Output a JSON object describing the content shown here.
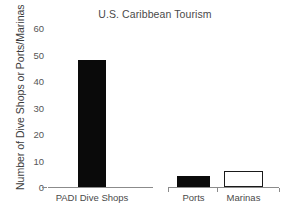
{
  "chart_data": {
    "type": "bar",
    "title": "U.S. Caribbean Tourism",
    "xlabel": "",
    "ylabel": "Number of Dive Shops or Ports/Marinas",
    "categories": [
      "PADI Dive Shops",
      "Ports",
      "Marinas"
    ],
    "values": [
      48,
      4,
      6
    ],
    "series": [
      {
        "name": "U.S. Caribbean Tourism",
        "values": [
          48,
          4,
          6
        ]
      }
    ],
    "bar_styles": [
      "filled",
      "filled",
      "open"
    ],
    "ylim": [
      0,
      62
    ],
    "yticks": [
      0,
      10,
      20,
      30,
      40,
      50,
      60
    ],
    "ytick_labels": [
      "0",
      "10",
      "20",
      "30",
      "40",
      "50",
      "60"
    ],
    "grid": false,
    "legend": null,
    "legend_position": "none",
    "groups": [
      {
        "name": "left-axis-group",
        "categories": [
          "PADI Dive Shops"
        ]
      },
      {
        "name": "right-axis-group",
        "categories": [
          "Ports",
          "Marinas"
        ]
      }
    ],
    "colors": {
      "bar_fill": "#0a0a0a",
      "bar_open_fill": "#ffffff",
      "bar_outline": "#1a1a1a",
      "axis": "#8b8b8b",
      "text": "#4a4a4a",
      "background": "#ffffff"
    }
  }
}
